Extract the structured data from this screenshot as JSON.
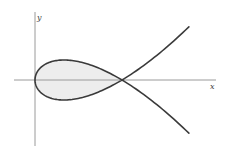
{
  "figure": {
    "axes": {
      "x_label": "x",
      "y_label": "y"
    },
    "curve": {
      "parametric": {
        "x": "t^2",
        "y": "t^3 - t"
      },
      "t_range": [
        -1.33,
        1.33
      ],
      "loop_t_range": [
        -1,
        1
      ],
      "node_point": [
        1,
        0
      ],
      "vertex_point": [
        0,
        0
      ]
    },
    "colors": {
      "curve": "#3a3a3a",
      "axes": "#9a9a9a",
      "loop_fill": "#ededed",
      "background": "#ffffff"
    }
  }
}
